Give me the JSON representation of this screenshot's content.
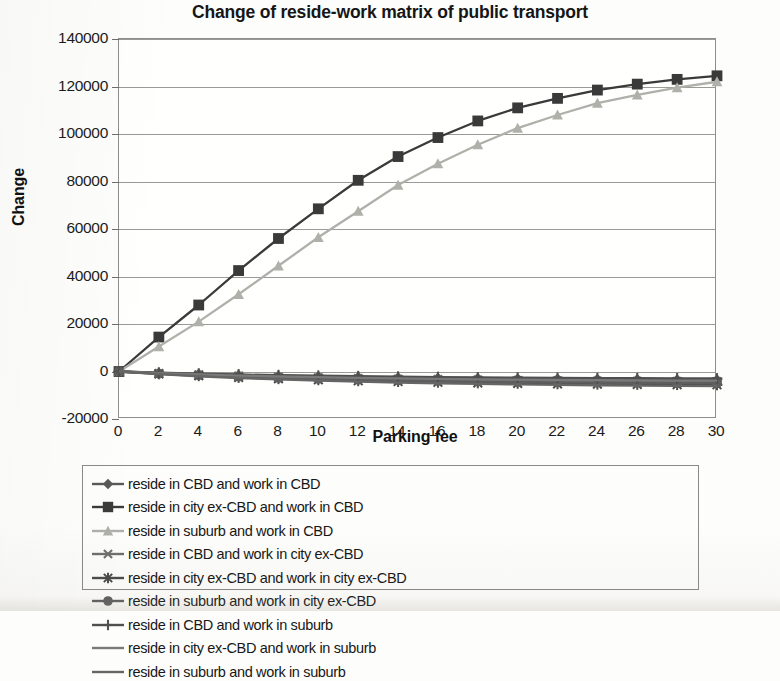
{
  "chart_data": {
    "type": "line",
    "title": "Change of reside-work matrix of public transport",
    "xlabel": "Parking fee",
    "ylabel": "Change",
    "x": [
      0,
      2,
      4,
      6,
      8,
      10,
      12,
      14,
      16,
      18,
      20,
      22,
      24,
      26,
      28,
      30
    ],
    "xlim": [
      0,
      30
    ],
    "ylim": [
      -20000,
      140000
    ],
    "ytick_labels": [
      "140000",
      "120000",
      "100000",
      "80000",
      "60000",
      "40000",
      "20000",
      "0",
      "-20000"
    ],
    "ytick_values": [
      140000,
      120000,
      100000,
      80000,
      60000,
      40000,
      20000,
      0,
      -20000
    ],
    "xtick_labels": [
      "0",
      "2",
      "4",
      "6",
      "8",
      "10",
      "12",
      "14",
      "16",
      "18",
      "20",
      "22",
      "24",
      "26",
      "28",
      "30"
    ],
    "grid": "horizontal",
    "legend_position": "bottom",
    "series": [
      {
        "name": "reside in CBD and work in CBD",
        "marker": "diamond",
        "color": "#595959",
        "values": [
          0,
          -600,
          -1100,
          -1500,
          -1800,
          -2100,
          -2300,
          -2500,
          -2700,
          -2850,
          -3000,
          -3100,
          -3200,
          -3300,
          -3400,
          -3450
        ]
      },
      {
        "name": "reside in city ex-CBD and work in CBD",
        "marker": "square",
        "color": "#3a3a3a",
        "values": [
          0,
          14500,
          28000,
          42500,
          56000,
          68500,
          80500,
          90500,
          98500,
          105500,
          111000,
          115000,
          118500,
          121000,
          123000,
          124500
        ]
      },
      {
        "name": "reside in suburb and work in CBD",
        "marker": "triangle",
        "color": "#b0b0aa",
        "values": [
          0,
          10500,
          21000,
          32500,
          44500,
          56500,
          67500,
          78500,
          87500,
          95500,
          102500,
          108000,
          113000,
          116500,
          119500,
          122000
        ]
      },
      {
        "name": "reside in CBD and work in city ex-CBD",
        "marker": "x-cross",
        "color": "#6e6e6e",
        "values": [
          0,
          -800,
          -1400,
          -1900,
          -2300,
          -2650,
          -2950,
          -3200,
          -3400,
          -3600,
          -3750,
          -3900,
          -4000,
          -4100,
          -4200,
          -4250
        ]
      },
      {
        "name": "reside in city ex-CBD and work in city ex-CBD",
        "marker": "asterisk",
        "color": "#4a4a4a",
        "values": [
          0,
          -1000,
          -1800,
          -2500,
          -3050,
          -3500,
          -3900,
          -4250,
          -4550,
          -4800,
          -5000,
          -5200,
          -5350,
          -5450,
          -5550,
          -5600
        ]
      },
      {
        "name": "reside in suburb and work in city ex-CBD",
        "marker": "circle",
        "color": "#5e5e5e",
        "values": [
          0,
          -900,
          -1600,
          -2200,
          -2700,
          -3100,
          -3450,
          -3750,
          -4000,
          -4200,
          -4400,
          -4550,
          -4650,
          -4750,
          -4850,
          -4900
        ]
      },
      {
        "name": "reside in CBD and work in suburb",
        "marker": "plus",
        "color": "#4f4f4f",
        "values": [
          0,
          -500,
          -900,
          -1250,
          -1550,
          -1800,
          -2000,
          -2200,
          -2350,
          -2500,
          -2600,
          -2700,
          -2780,
          -2850,
          -2900,
          -2950
        ]
      },
      {
        "name": "reside in city ex-CBD and work in suburb",
        "marker": "none",
        "color": "#7a7a7a",
        "values": [
          0,
          -700,
          -1250,
          -1700,
          -2100,
          -2400,
          -2700,
          -2930,
          -3120,
          -3300,
          -3450,
          -3570,
          -3670,
          -3750,
          -3820,
          -3870
        ]
      },
      {
        "name": "reside in suburb and work in suburb",
        "marker": "none",
        "color": "#666666",
        "values": [
          0,
          -1100,
          -2000,
          -2750,
          -3350,
          -3850,
          -4300,
          -4650,
          -4950,
          -5200,
          -5450,
          -5650,
          -5800,
          -5920,
          -6020,
          -6100
        ]
      }
    ]
  },
  "legend": {
    "entries": [
      {
        "label": "reside in CBD and work in CBD",
        "marker": "diamond",
        "color": "#595959"
      },
      {
        "label": "reside in city ex-CBD and work in CBD",
        "marker": "square",
        "color": "#3a3a3a"
      },
      {
        "label": "reside in suburb and work in CBD",
        "marker": "triangle",
        "color": "#b0b0aa"
      },
      {
        "label": "reside in CBD and work in city ex-CBD",
        "marker": "x-cross",
        "color": "#6e6e6e"
      },
      {
        "label": "reside in city ex-CBD and work in city ex-CBD",
        "marker": "asterisk",
        "color": "#4a4a4a"
      },
      {
        "label": "reside in suburb and work in city ex-CBD",
        "marker": "circle",
        "color": "#5e5e5e"
      },
      {
        "label": "reside in CBD and work in suburb",
        "marker": "plus",
        "color": "#4f4f4f"
      },
      {
        "label": "reside in city ex-CBD and work in suburb",
        "marker": "none",
        "color": "#7a7a7a"
      },
      {
        "label": "reside in suburb and work in suburb",
        "marker": "none",
        "color": "#666666"
      }
    ]
  }
}
